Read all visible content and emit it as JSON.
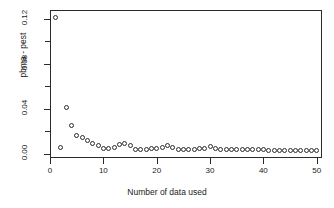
{
  "chart_data": {
    "type": "scatter",
    "title": "",
    "xlabel": "Number of data used",
    "ylabel": "pbma - pest",
    "xlim": [
      0,
      51
    ],
    "ylim": [
      -0.004,
      0.128
    ],
    "grid": false,
    "legend": "none",
    "marker": "open-circle",
    "xticks": [
      0,
      10,
      20,
      30,
      40,
      50
    ],
    "xtick_labels": [
      "0",
      "10",
      "20",
      "30",
      "40",
      "50"
    ],
    "yticks": [
      0.0,
      0.02,
      0.04,
      0.06,
      0.08,
      0.1,
      0.12
    ],
    "ytick_labels": [
      "0.00",
      "",
      "0.04",
      "",
      "0.08",
      "",
      "0.12"
    ],
    "x": [
      1,
      2,
      3,
      4,
      5,
      6,
      7,
      8,
      9,
      10,
      11,
      12,
      13,
      14,
      15,
      16,
      17,
      18,
      19,
      20,
      21,
      22,
      23,
      24,
      25,
      26,
      27,
      28,
      29,
      30,
      31,
      32,
      33,
      34,
      35,
      36,
      37,
      38,
      39,
      40,
      41,
      42,
      43,
      44,
      45,
      46,
      47,
      48,
      49,
      50
    ],
    "y": [
      0.1215,
      0.005,
      0.041,
      0.025,
      0.016,
      0.0145,
      0.0115,
      0.009,
      0.0075,
      0.0048,
      0.0042,
      0.0055,
      0.0082,
      0.0085,
      0.007,
      0.004,
      0.0038,
      0.004,
      0.0045,
      0.0048,
      0.0052,
      0.0072,
      0.0052,
      0.004,
      0.0038,
      0.0036,
      0.0038,
      0.0042,
      0.0048,
      0.006,
      0.0042,
      0.0036,
      0.0034,
      0.0032,
      0.0032,
      0.0034,
      0.0034,
      0.0036,
      0.0034,
      0.0032,
      0.003,
      0.003,
      0.0028,
      0.0028,
      0.0028,
      0.0026,
      0.0026,
      0.0026,
      0.0026,
      0.003
    ]
  },
  "axis": {
    "y_minor_ticks": [
      0.02,
      0.06,
      0.1
    ]
  },
  "colors": {
    "frame": "#2b2b2b",
    "marker": "#2b2b2b",
    "background": "#ffffff"
  }
}
